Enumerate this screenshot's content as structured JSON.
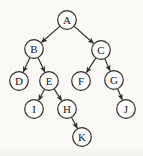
{
  "colors": {
    "background": "#faf9f6",
    "node_fill": "#fcfcfa",
    "stroke": "#2e2c2a",
    "label_text": "#171615"
  },
  "diagram": {
    "type": "tree",
    "node_radius": 9.3,
    "canvas": {
      "width": 143,
      "height": 156
    },
    "nodes": [
      {
        "id": "A",
        "label": "A",
        "x": 67,
        "y": 20
      },
      {
        "id": "B",
        "label": "B",
        "x": 34,
        "y": 49
      },
      {
        "id": "C",
        "label": "C",
        "x": 101,
        "y": 50
      },
      {
        "id": "D",
        "label": "D",
        "x": 19,
        "y": 81
      },
      {
        "id": "E",
        "label": "E",
        "x": 49,
        "y": 81
      },
      {
        "id": "F",
        "label": "F",
        "x": 81,
        "y": 81
      },
      {
        "id": "G",
        "label": "G",
        "x": 114,
        "y": 80
      },
      {
        "id": "I",
        "label": "I",
        "x": 34,
        "y": 109
      },
      {
        "id": "H",
        "label": "H",
        "x": 67,
        "y": 109
      },
      {
        "id": "J",
        "label": "J",
        "x": 126,
        "y": 109
      },
      {
        "id": "K",
        "label": "K",
        "x": 82,
        "y": 137
      }
    ],
    "edges": [
      {
        "from": "A",
        "to": "B"
      },
      {
        "from": "A",
        "to": "C"
      },
      {
        "from": "B",
        "to": "D"
      },
      {
        "from": "B",
        "to": "E"
      },
      {
        "from": "C",
        "to": "F"
      },
      {
        "from": "C",
        "to": "G"
      },
      {
        "from": "E",
        "to": "I"
      },
      {
        "from": "E",
        "to": "H"
      },
      {
        "from": "G",
        "to": "J"
      },
      {
        "from": "H",
        "to": "K"
      }
    ]
  }
}
